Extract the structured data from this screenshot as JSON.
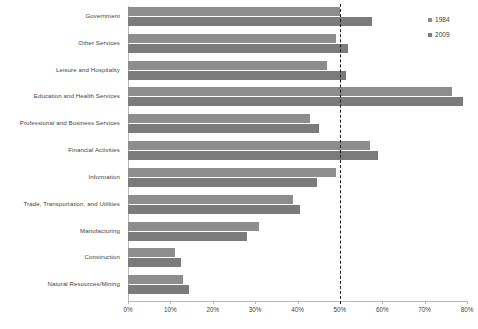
{
  "chart_data": {
    "type": "bar",
    "orientation": "horizontal",
    "title": "",
    "xlabel": "",
    "ylabel": "",
    "xlim": [
      0,
      80
    ],
    "xtick_labels": [
      "0%",
      "10%",
      "20%",
      "30%",
      "40%",
      "50%",
      "60%",
      "70%",
      "80%"
    ],
    "xticks": [
      0,
      10,
      20,
      30,
      40,
      50,
      60,
      70,
      80
    ],
    "grid": false,
    "legend_position": "top-right",
    "categories": [
      "Government",
      "Other Services",
      "Leisure and Hospitality",
      "Education and Health Services",
      "Professional and Business Services",
      "Financial Activities",
      "Information",
      "Trade, Transportation, and Utilities",
      "Manufacturing",
      "Construction",
      "Natural Resources/Mining"
    ],
    "series": [
      {
        "name": "1984",
        "color": "#8d8d8d",
        "values": [
          50.0,
          49.0,
          47.0,
          76.5,
          43.0,
          57.0,
          49.0,
          39.0,
          31.0,
          11.0,
          13.0
        ]
      },
      {
        "name": "2009",
        "color": "#7b7b7b",
        "values": [
          57.5,
          52.0,
          51.5,
          79.0,
          45.0,
          59.0,
          44.5,
          40.5,
          28.0,
          12.5,
          14.5
        ]
      }
    ],
    "annotations": [
      {
        "type": "reference-line",
        "value": 50,
        "style": "dashed",
        "color": "#1a1a1a"
      }
    ]
  },
  "legend": {
    "items": [
      {
        "label": "1984",
        "color": "#8d8d8d"
      },
      {
        "label": "2009",
        "color": "#7b7b7b"
      }
    ]
  }
}
